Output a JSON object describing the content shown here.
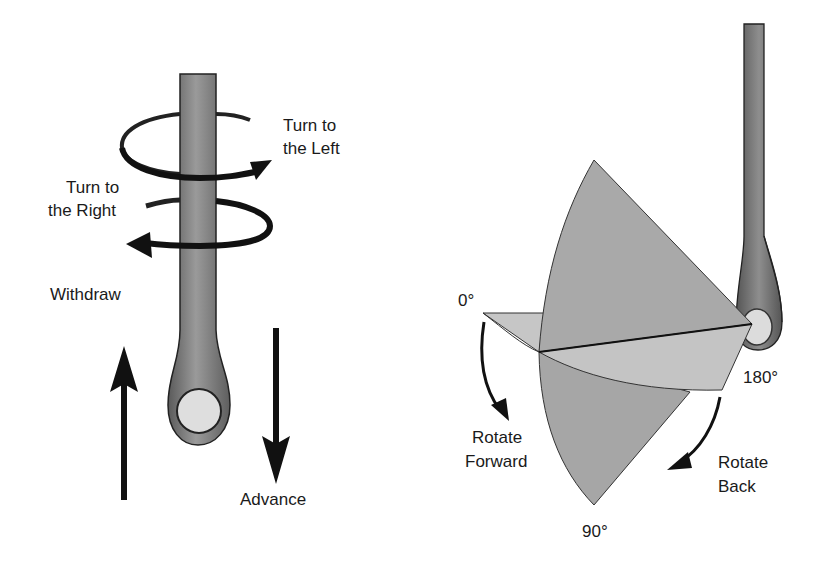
{
  "left_diagram": {
    "labels": {
      "turn_left_line1": "Turn to",
      "turn_left_line2": "the Left",
      "turn_right_line1": "Turn to",
      "turn_right_line2": "the Right",
      "withdraw": "Withdraw",
      "advance": "Advance"
    },
    "icons": [
      "scope-shaft-icon",
      "turn-left-arrow-icon",
      "turn-right-arrow-icon",
      "withdraw-arrow-icon",
      "advance-arrow-icon"
    ]
  },
  "right_diagram": {
    "labels": {
      "angle_0": "0°",
      "angle_90": "90°",
      "angle_180": "180°",
      "rotate_forward_line1": "Rotate",
      "rotate_forward_line2": "Forward",
      "rotate_back_line1": "Rotate",
      "rotate_back_line2": "Back"
    },
    "icons": [
      "scope-shaft-icon",
      "rotation-fan-icon",
      "rotate-forward-arrow-icon",
      "rotate-back-arrow-icon"
    ]
  },
  "colors": {
    "shaft": "#7a7a7a",
    "shaft_dark": "#4a4a4a",
    "ring_fill": "#dcdcdc",
    "fan_dark": "#a9a9a9",
    "fan_light": "#c4c4c4",
    "arrow": "#111111"
  }
}
